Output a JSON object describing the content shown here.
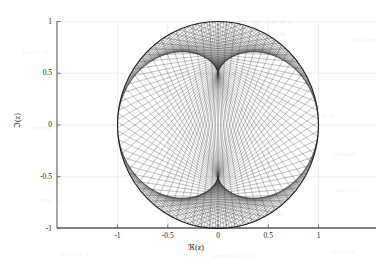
{
  "figure": {
    "background_color": "#ffffff",
    "plot_type": "parametric-chord-envelope",
    "xlabel": "ℜ(z)",
    "ylabel": "ℑ(z)",
    "title": ""
  },
  "axes": {
    "x_axis_color": "#595959",
    "y_axis_color": "#595959",
    "grid_color": "#e8e8ee",
    "grid_on": true,
    "tick_color": "#595959",
    "x_ticks": [
      "-1",
      "-0.5",
      "0",
      "0.5",
      "1"
    ],
    "x_tick_values": [
      -1,
      -0.5,
      0,
      0.5,
      1
    ],
    "y_ticks": [
      "1",
      "0.5",
      "0",
      "-0.5",
      "-1"
    ],
    "y_tick_values": [
      1,
      0.5,
      0,
      -0.5,
      -1
    ],
    "xlim": [
      -1.6,
      1.58
    ],
    "ylim": [
      -1.06,
      1.04
    ]
  },
  "chart_data": {
    "type": "line",
    "title": "",
    "xlabel": "ℜ(z)",
    "ylabel": "ℑ(z)",
    "xlim": [
      -1.6,
      1.58
    ],
    "ylim": [
      -1.06,
      1.04
    ],
    "grid": true,
    "legend": "none",
    "series": [
      {
        "name": "unit circle",
        "kind": "circle",
        "center": [
          0,
          0
        ],
        "radius": 1,
        "color": "#1a1a1a",
        "linewidth": 1.1,
        "fill": "none"
      },
      {
        "name": "chord family z -> z^3",
        "kind": "chords",
        "description": "Chords joining e^{i t} to e^{3 i t} on the unit circle; the dense envelope forms a dark cardioid-like caustic region.",
        "n_chords": 220,
        "t_start": 0,
        "t_end": 6.283185307179586,
        "map_exponent": 3,
        "color": "#303030",
        "linewidth": 0.35,
        "alpha": 0.85
      }
    ],
    "annotations": [
      {
        "text": "envelope cusp",
        "x": 0.36,
        "y": 0.96,
        "visible": false
      },
      {
        "text": "envelope cusp",
        "x": -0.79,
        "y": -0.61,
        "visible": false
      },
      {
        "text": "envelope cusp",
        "x": 0.85,
        "y": -0.53,
        "visible": false
      }
    ]
  },
  "background_artifacts": {
    "visible": true,
    "note": "faint show-through of text from the reverse side of the scanned page",
    "lines": [
      {
        "text": "for the case of a",
        "x": 240,
        "y": 18
      },
      {
        "text": "in the complex plane and",
        "x": 205,
        "y": 30
      },
      {
        "text": "we obtain the following",
        "x": 158,
        "y": 44
      },
      {
        "text": "it follows that",
        "x": 230,
        "y": 56
      },
      {
        "text": "the unit disk",
        "x": 196,
        "y": 70
      },
      {
        "text": "and therefore the",
        "x": 118,
        "y": 86
      },
      {
        "text": "bounded region",
        "x": 260,
        "y": 98
      },
      {
        "text": "which is a",
        "x": 300,
        "y": 112
      },
      {
        "text": "proof of",
        "x": 22,
        "y": 48
      },
      {
        "text": "lemma",
        "x": 30,
        "y": 124
      },
      {
        "text": "remark",
        "x": 334,
        "y": 150
      },
      {
        "text": "theorem",
        "x": 352,
        "y": 36
      },
      {
        "text": "map is",
        "x": 40,
        "y": 196
      },
      {
        "text": "analytic",
        "x": 336,
        "y": 186
      },
      {
        "text": "the boundary curve",
        "x": 222,
        "y": 210
      },
      {
        "text": "section 4",
        "x": 60,
        "y": 250
      },
      {
        "text": "equation (3.7)",
        "x": 212,
        "y": 252
      },
      {
        "text": "see also",
        "x": 330,
        "y": 248
      }
    ]
  }
}
